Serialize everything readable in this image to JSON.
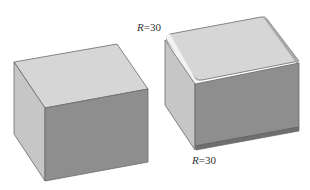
{
  "figure": {
    "left_box": {
      "description": "Plain rectangular block (sharp edges)"
    },
    "right_box": {
      "description": "Rectangular block with rounded (fillet) edges",
      "labels": [
        {
          "id": "top_fillet",
          "var": "R",
          "eq": "=30"
        },
        {
          "id": "bottom_fillet",
          "var": "R",
          "eq": "=30"
        }
      ]
    }
  },
  "colors": {
    "top_face": "#d6d6d6",
    "left_face": "#c4c4c4",
    "front_face": "#8e8e8e",
    "edge": "#6a6a6a",
    "fillet_highlight": "#f2f2f2",
    "bottom_fillet": "#6f6f6f"
  }
}
